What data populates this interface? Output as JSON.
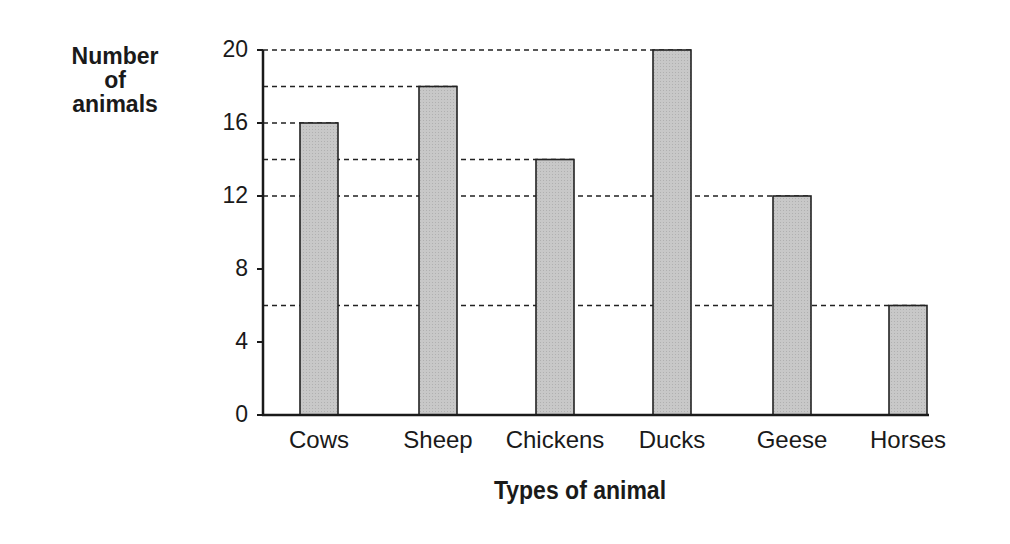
{
  "chart_data": {
    "type": "bar",
    "title": "",
    "xlabel": "Types of animal",
    "ylabel": "Number of animals",
    "ylabel_lines": [
      "Number",
      "of",
      "animals"
    ],
    "categories": [
      "Cows",
      "Sheep",
      "Chickens",
      "Ducks",
      "Geese",
      "Horses"
    ],
    "values": [
      16,
      18,
      14,
      20,
      12,
      6
    ],
    "ylim": [
      0,
      20
    ],
    "yticks": [
      0,
      4,
      8,
      12,
      16,
      20
    ],
    "grid": false,
    "reference_lines": "dashed horizontal lines from y-axis to top of each bar",
    "bar_color": "#c8c8c8",
    "bar_edge_color": "#222222"
  }
}
